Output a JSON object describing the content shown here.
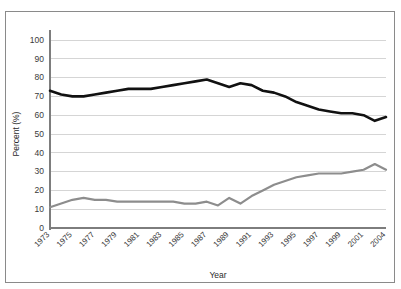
{
  "caption": {
    "text": "",
    "visible": false
  },
  "frame": {
    "border_color": "#8a8a8a",
    "background": "#ffffff"
  },
  "chart_data": {
    "type": "line",
    "title": "",
    "xlabel": "Year",
    "ylabel": "Percent (%)",
    "ylim": [
      0,
      100
    ],
    "ytick_step": 10,
    "yticks": [
      0,
      10,
      20,
      30,
      40,
      50,
      60,
      70,
      80,
      90,
      100
    ],
    "grid": true,
    "legend": "none",
    "x": [
      1973,
      1974,
      1975,
      1976,
      1977,
      1978,
      1979,
      1980,
      1981,
      1982,
      1983,
      1984,
      1985,
      1986,
      1987,
      1988,
      1989,
      1990,
      1991,
      1992,
      1993,
      1994,
      1995,
      1996,
      1997,
      1998,
      1999,
      2000,
      2001,
      2002,
      2004
    ],
    "xtick_labels": [
      "1973",
      "1975",
      "1977",
      "1979",
      "1981",
      "1983",
      "1985",
      "1987",
      "1989",
      "1991",
      "1993",
      "1995",
      "1997",
      "1999",
      "2001",
      "2004"
    ],
    "xtick_values": [
      1973,
      1975,
      1977,
      1979,
      1981,
      1983,
      1985,
      1987,
      1989,
      1991,
      1993,
      1995,
      1997,
      1999,
      2001,
      2004
    ],
    "series": [
      {
        "name": "upper-series",
        "color": "#111111",
        "width": 2.6,
        "values": [
          73,
          71,
          70,
          70,
          71,
          72,
          73,
          74,
          74,
          74,
          75,
          76,
          77,
          78,
          79,
          77,
          75,
          77,
          76,
          73,
          72,
          70,
          67,
          65,
          63,
          62,
          61,
          61,
          60,
          57,
          59
        ]
      },
      {
        "name": "lower-series",
        "color": "#8d8d8d",
        "width": 2.2,
        "values": [
          11,
          13,
          15,
          16,
          15,
          15,
          14,
          14,
          14,
          14,
          14,
          14,
          13,
          13,
          14,
          12,
          16,
          13,
          17,
          20,
          23,
          25,
          27,
          28,
          29,
          29,
          29,
          30,
          31,
          34,
          31
        ]
      }
    ]
  }
}
